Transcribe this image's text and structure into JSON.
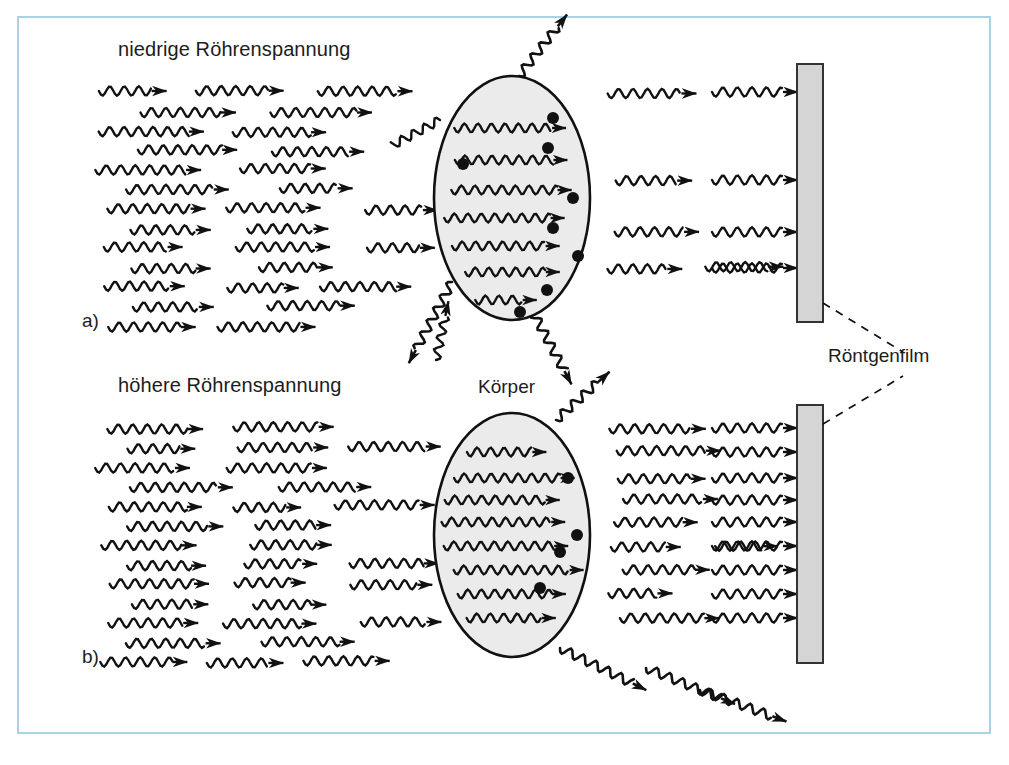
{
  "figure": {
    "kind": "physics-diagram",
    "background_color": "#ffffff",
    "frame_color": "#a9d3e4",
    "ink_color": "#111111",
    "body_fill_color": "#ebebeb"
  },
  "labels": {
    "panel_a_marker": "a)",
    "panel_b_marker": "b)",
    "panel_a_title": "niedrige Röhrenspannung",
    "panel_b_title": "höhere Röhrenspannung",
    "body_label": "Körper",
    "film_label": "Röntgenfilm"
  },
  "panels": [
    {
      "id": "a",
      "marker": "a)",
      "title": "niedrige Röhrenspannung",
      "incoming_ray_rows": 13,
      "transmitted_ray_rows": 4,
      "absorption_dots": 8,
      "scattered_rays": 4,
      "body": {
        "cx": 512,
        "cy": 198,
        "rx": 78,
        "ry": 122
      },
      "film": {
        "x": 797,
        "y": 64,
        "width": 26,
        "height": 258
      }
    },
    {
      "id": "b",
      "marker": "b)",
      "title": "höhere Röhrenspannung",
      "incoming_ray_rows": 13,
      "transmitted_ray_rows": 8,
      "absorption_dots": 4,
      "scattered_rays": 4,
      "body": {
        "cx": 512,
        "cy": 535,
        "rx": 78,
        "ry": 122
      },
      "film": {
        "x": 797,
        "y": 405,
        "width": 26,
        "height": 258
      }
    }
  ],
  "film_callout": {
    "text": "Röntgenfilm",
    "leader_to_panel_a_film": true,
    "leader_to_panel_b_film": true
  }
}
